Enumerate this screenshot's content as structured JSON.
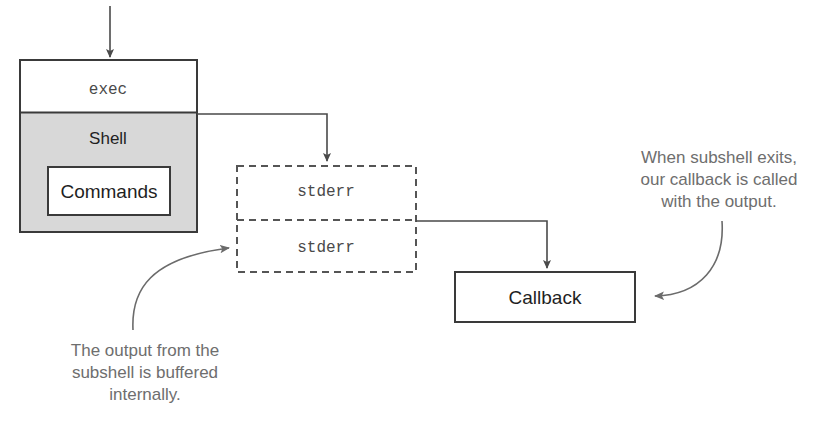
{
  "diagram": {
    "title_cropped": "",
    "shell_block": {
      "exec_label": "exec",
      "shell_label": "Shell",
      "commands_label": "Commands"
    },
    "buffer_block": {
      "top_label": "stderr",
      "bottom_label": "stderr"
    },
    "callback_block": {
      "label": "Callback"
    },
    "captions": {
      "bottom_left": {
        "line1": "The output from the",
        "line2": "subshell is buffered",
        "line3": "internally."
      },
      "right": {
        "line1": "When subshell exits,",
        "line2": "our callback is called",
        "line3": "with the output."
      }
    },
    "colors": {
      "shell_fill": "#d8d8d8",
      "stroke": "#3a3a3a",
      "dashed_stroke": "#555555",
      "caption_text": "#6e6e6e",
      "background": "#ffffff"
    }
  }
}
